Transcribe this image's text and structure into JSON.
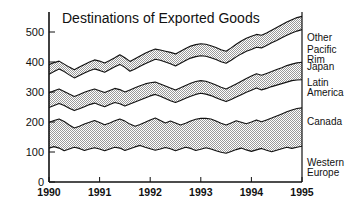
{
  "chart_data": {
    "type": "area",
    "stacked": true,
    "title": "Destinations of Exported Goods",
    "xlabel": "",
    "ylabel": "",
    "xlim": [
      1990,
      1995
    ],
    "ylim": [
      0,
      560
    ],
    "yticks": [
      0,
      100,
      200,
      300,
      400,
      500
    ],
    "xticks": [
      1990,
      1991,
      1992,
      1993,
      1994,
      1995
    ],
    "xtick_labels": [
      "1990",
      "1991",
      "1992",
      "1993",
      "1994",
      "1995"
    ],
    "ytick_labels": [
      "0",
      "100",
      "200",
      "300",
      "400",
      "500"
    ],
    "grid": false,
    "legend_position": "right-outside",
    "x": [
      1990.0,
      1990.1,
      1990.2,
      1990.3,
      1990.4,
      1990.5,
      1990.6,
      1990.7,
      1990.8,
      1990.9,
      1991.0,
      1991.1,
      1991.2,
      1991.3,
      1991.4,
      1991.5,
      1991.6,
      1991.7,
      1991.8,
      1991.9,
      1992.0,
      1992.1,
      1992.2,
      1992.3,
      1992.4,
      1992.5,
      1992.6,
      1992.7,
      1992.8,
      1992.9,
      1993.0,
      1993.1,
      1993.2,
      1993.3,
      1993.4,
      1993.5,
      1993.6,
      1993.7,
      1993.8,
      1993.9,
      1994.0,
      1994.1,
      1994.2,
      1994.3,
      1994.4,
      1994.5,
      1994.6,
      1994.7,
      1994.8,
      1994.9,
      1995.0
    ],
    "series": [
      {
        "name": "Western Europe",
        "shaded": false,
        "cumulative_top": [
          113,
          118,
          113,
          104,
          110,
          116,
          112,
          105,
          110,
          114,
          110,
          104,
          110,
          116,
          113,
          105,
          111,
          117,
          122,
          116,
          111,
          106,
          110,
          115,
          111,
          104,
          110,
          116,
          112,
          105,
          109,
          114,
          110,
          104,
          99,
          96,
          102,
          108,
          113,
          107,
          102,
          107,
          112,
          106,
          101,
          106,
          111,
          116,
          112,
          116,
          119
        ]
      },
      {
        "name": "Canada",
        "shaded": true,
        "cumulative_top": [
          199,
          205,
          210,
          202,
          190,
          180,
          186,
          193,
          199,
          205,
          198,
          191,
          197,
          204,
          210,
          203,
          193,
          186,
          192,
          199,
          207,
          213,
          205,
          197,
          203,
          197,
          190,
          196,
          203,
          209,
          212,
          212,
          210,
          203,
          196,
          190,
          197,
          204,
          199,
          194,
          200,
          207,
          201,
          207,
          213,
          220,
          227,
          234,
          240,
          245,
          247
        ]
      },
      {
        "name": "Latin America",
        "shaded": false,
        "cumulative_top": [
          248,
          255,
          262,
          255,
          246,
          238,
          244,
          251,
          258,
          263,
          257,
          251,
          258,
          265,
          261,
          253,
          260,
          267,
          273,
          280,
          287,
          292,
          286,
          278,
          271,
          265,
          272,
          279,
          286,
          292,
          296,
          293,
          288,
          281,
          274,
          268,
          275,
          283,
          291,
          299,
          306,
          313,
          307,
          312,
          318,
          323,
          328,
          333,
          338,
          340,
          341
        ]
      },
      {
        "name": "Japan",
        "shaded": true,
        "cumulative_top": [
          297,
          304,
          310,
          302,
          293,
          285,
          292,
          299,
          305,
          310,
          304,
          298,
          305,
          312,
          308,
          300,
          307,
          314,
          321,
          327,
          331,
          333,
          327,
          320,
          313,
          307,
          314,
          322,
          329,
          335,
          338,
          336,
          330,
          323,
          316,
          310,
          318,
          327,
          336,
          345,
          353,
          361,
          356,
          362,
          368,
          375,
          381,
          388,
          393,
          397,
          399
        ]
      },
      {
        "name": "Pacific Rim",
        "shaded": false,
        "cumulative_top": [
          359,
          368,
          377,
          368,
          357,
          347,
          355,
          363,
          371,
          377,
          372,
          366,
          375,
          384,
          392,
          382,
          369,
          377,
          386,
          394,
          402,
          409,
          406,
          400,
          394,
          387,
          396,
          405,
          413,
          418,
          421,
          419,
          414,
          408,
          401,
          396,
          406,
          417,
          427,
          436,
          442,
          449,
          447,
          455,
          464,
          472,
          481,
          489,
          497,
          503,
          508
        ]
      },
      {
        "name": "Other",
        "shaded": true,
        "cumulative_top": [
          391,
          398,
          403,
          393,
          383,
          374,
          383,
          392,
          400,
          407,
          403,
          397,
          405,
          414,
          424,
          414,
          402,
          411,
          420,
          429,
          437,
          443,
          440,
          436,
          432,
          427,
          436,
          445,
          453,
          458,
          461,
          459,
          454,
          448,
          441,
          436,
          447,
          459,
          470,
          479,
          486,
          492,
          489,
          497,
          506,
          515,
          524,
          533,
          541,
          548,
          552
        ]
      }
    ]
  },
  "legend": {
    "items": [
      {
        "label": "Other",
        "label_line2": "",
        "value_anchor": 471
      },
      {
        "label": "Pacific",
        "label_line2": "Rim",
        "value_anchor": 430
      },
      {
        "label": "Japan",
        "label_line2": "",
        "value_anchor": 372
      },
      {
        "label": "Latin",
        "label_line2": "America",
        "value_anchor": 320
      },
      {
        "label": "Canada",
        "label_line2": "",
        "value_anchor": 190
      },
      {
        "label": "Western",
        "label_line2": "Europe",
        "value_anchor": 55
      }
    ]
  },
  "colors": {
    "shaded_fill": "#d8d8d8",
    "unshaded_fill": "#ffffff",
    "line": "#111111",
    "text": "#111111",
    "background": "#ffffff"
  }
}
